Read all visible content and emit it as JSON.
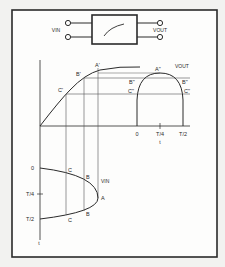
{
  "colors": {
    "background": "#f2f2f0",
    "panel": "#fdfdfc",
    "ink": "#2a2a2a",
    "grid": "#8a8a8a"
  },
  "circuit": {
    "input_label": "VIN",
    "output_label": "VOUT",
    "box_symbol": "transfer-curve"
  },
  "transfer_plot": {
    "points": {
      "a": "A'",
      "b": "B'",
      "c": "C'"
    }
  },
  "output_plot": {
    "y_label": "VOUT",
    "points": {
      "a": "A\"",
      "b_left": "B\"",
      "b_right": "B\"",
      "c_left": "C\"",
      "c_right": "C\""
    },
    "x_ticks": [
      "0",
      "T/4",
      "T/2"
    ],
    "x_label": "t"
  },
  "input_plot": {
    "curve_label": "VIN",
    "points": {
      "a": "A",
      "b_top": "B",
      "b_bottom": "B",
      "c_top": "C",
      "c_bottom": "C"
    },
    "y_ticks": [
      "0",
      "T/4",
      "T/2"
    ],
    "y_label": "t"
  }
}
